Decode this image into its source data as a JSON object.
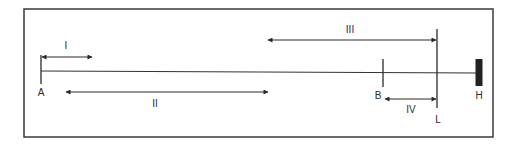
{
  "diagram": {
    "frame": {
      "x": 24,
      "y": 9,
      "width": 469,
      "height": 128,
      "stroke": "#3a3a3a"
    },
    "baseline": {
      "x1": 41,
      "y1": 71,
      "x2": 479,
      "y2": 73,
      "stroke": "#333333"
    },
    "points": [
      {
        "id": "A",
        "label": "A",
        "x": 41,
        "tick_top": 55,
        "tick_bottom": 84,
        "label_x": 41,
        "label_y": 96
      },
      {
        "id": "B",
        "label": "B",
        "x": 383,
        "tick_top": 59,
        "tick_bottom": 87,
        "label_x": 378,
        "label_y": 99
      },
      {
        "id": "L",
        "label": "L",
        "x": 437,
        "tick_top": 29,
        "tick_bottom": 108,
        "label_x": 438,
        "label_y": 123
      },
      {
        "id": "H",
        "label": "H",
        "x": 479,
        "tick_top": 59,
        "tick_bottom": 86,
        "label_x": 479,
        "label_y": 99,
        "block_width": 7,
        "fill": "#222222"
      }
    ],
    "arrows": [
      {
        "id": "I",
        "label": "I",
        "x1": 42,
        "x2": 92,
        "y": 57,
        "heads": "both",
        "label_x": 66,
        "label_y": 49
      },
      {
        "id": "II",
        "label": "II",
        "x1": 66,
        "x2": 268,
        "y": 92,
        "heads": "both",
        "label_x": 155,
        "label_y": 107
      },
      {
        "id": "III",
        "label": "III",
        "x1": 268,
        "x2": 436,
        "y": 40,
        "heads": "both",
        "label_x": 350,
        "label_y": 33
      },
      {
        "id": "IV",
        "label": "IV",
        "x1": 385,
        "x2": 436,
        "y": 99,
        "heads": "both",
        "label_x": 411,
        "label_y": 113
      }
    ],
    "ink_color": "#2a2a2a"
  }
}
